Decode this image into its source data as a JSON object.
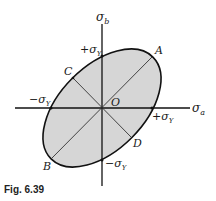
{
  "figure": {
    "caption": "Fig. 6.39",
    "axes": {
      "x_label": "σ",
      "x_sub": "a",
      "y_label": "σ",
      "y_sub": "b"
    },
    "intercepts": {
      "top": "+σ",
      "top_sub": "Y",
      "bottom": "−σ",
      "bottom_sub": "Y",
      "left": "−σ",
      "left_sub": "Y",
      "right": "+σ",
      "right_sub": "Y"
    },
    "points": {
      "origin": "O",
      "A": "A",
      "B": "B",
      "C": "C",
      "D": "D"
    },
    "colors": {
      "fill": "#d6d6d6",
      "stroke": "#111111"
    }
  }
}
